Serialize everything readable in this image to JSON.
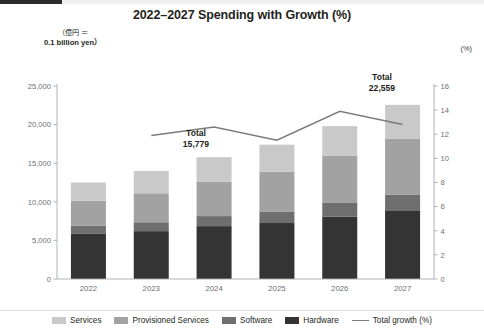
{
  "header": {
    "title": "2022–2027 Spending with Growth (%)",
    "unit_note_line1": "（億円 ＝",
    "unit_note_line2": "0.1 billion yen）",
    "right_axis_unit": "(%)"
  },
  "annotations": [
    {
      "name": "total-2024",
      "label": "Total",
      "value": "15,779",
      "x": 196,
      "y": 128
    },
    {
      "name": "total-2027",
      "label": "Total",
      "value": "22,559",
      "x": 382,
      "y": 72
    }
  ],
  "legend": {
    "position": "bottom",
    "items": [
      {
        "label": "Services",
        "color": "#c9c9c9",
        "type": "swatch"
      },
      {
        "label": "Provisioned Services",
        "color": "#a2a2a2",
        "type": "swatch"
      },
      {
        "label": "Software",
        "color": "#6f6f6f",
        "type": "swatch"
      },
      {
        "label": "Hardware",
        "color": "#343434",
        "type": "swatch"
      },
      {
        "label": "Total growth (%)",
        "color": "#7b7b7b",
        "type": "line"
      }
    ]
  },
  "chart_data": {
    "type": "bar",
    "title": "2022–2027 Spending with Growth (%)",
    "xlabel": "",
    "ylabel": "",
    "categories": [
      "2022",
      "2023",
      "2024",
      "2025",
      "2026",
      "2027"
    ],
    "ylim": [
      0,
      25000
    ],
    "yticks": [
      0,
      5000,
      10000,
      15000,
      20000,
      25000
    ],
    "ytick_labels": [
      "0",
      "5,000",
      "10,000",
      "15,000",
      "20,000",
      "25,000"
    ],
    "y2lim": [
      0,
      16
    ],
    "y2ticks": [
      0,
      2,
      4,
      6,
      8,
      10,
      12,
      14,
      16
    ],
    "y2tick_labels": [
      "0",
      "2",
      "4",
      "6",
      "8",
      "10",
      "12",
      "14",
      "16"
    ],
    "y2label": "(%)",
    "grid": false,
    "stacked": true,
    "series": [
      {
        "name": "Hardware",
        "color": "#343434",
        "values": [
          5850,
          6200,
          6850,
          7250,
          8100,
          8900
        ]
      },
      {
        "name": "Software",
        "color": "#6f6f6f",
        "values": [
          1050,
          1150,
          1300,
          1500,
          1750,
          2000
        ]
      },
      {
        "name": "Provisioned Services",
        "color": "#a2a2a2",
        "values": [
          3250,
          3750,
          4450,
          5150,
          6100,
          7250
        ]
      },
      {
        "name": "Services",
        "color": "#c9c9c9",
        "values": [
          2350,
          2900,
          3179,
          3500,
          3850,
          4409
        ]
      }
    ],
    "totals": [
      12500,
      14000,
      15779,
      17400,
      19800,
      22559
    ],
    "line_series": {
      "name": "Total growth (%)",
      "color": "#7b7b7b",
      "axis": "right",
      "x": [
        "2023",
        "2024",
        "2025",
        "2026",
        "2027"
      ],
      "values": [
        11.9,
        12.6,
        11.5,
        13.9,
        12.8
      ]
    }
  }
}
